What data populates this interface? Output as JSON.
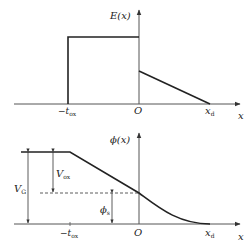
{
  "top_plot": {
    "y_label": "E(x)",
    "x_label": "x",
    "ticks": {
      "neg_tox": {
        "prefix": "−t",
        "sub": "ox"
      },
      "origin": "O",
      "xd": {
        "main": "x",
        "sub": "d"
      }
    }
  },
  "bottom_plot": {
    "y_label": "ϕ(x)",
    "x_label": "x",
    "ticks": {
      "neg_tox": {
        "prefix": "−t",
        "sub": "ox"
      },
      "origin": "O",
      "xd": {
        "main": "x",
        "sub": "d"
      }
    },
    "annotations": {
      "vg": {
        "main": "V",
        "sub": "G"
      },
      "vox": {
        "main": "V",
        "sub": "ox"
      },
      "phis": {
        "main": "ϕ",
        "sub": "s"
      }
    }
  },
  "colors": {
    "line": "#222222",
    "axis": "#555555"
  }
}
